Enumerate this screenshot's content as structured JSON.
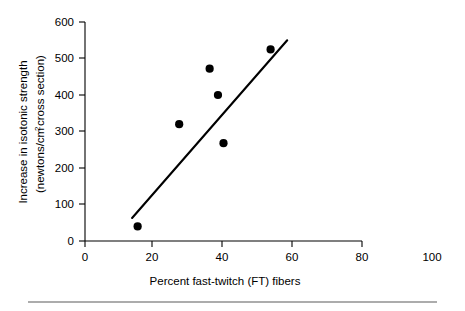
{
  "chart_data": {
    "type": "scatter",
    "title": "",
    "xlabel": "Percent fast-twitch (FT) fibers",
    "ylabel": "Increase in isotonic strength (newtons/cm² cross section)",
    "ylabel_line1": "Increase in isotonic strength",
    "ylabel_line2": "(newtons/cm",
    "ylabel_line2_sup": "2",
    "ylabel_line2_tail": " cross section)",
    "xlim": [
      0,
      100
    ],
    "ylim": [
      0,
      600
    ],
    "xticks": [
      0,
      20,
      40,
      60,
      80,
      100
    ],
    "yticks": [
      0,
      100,
      200,
      300,
      400,
      500,
      600
    ],
    "xtick_labels": [
      "0",
      "20",
      "40",
      "60",
      "80",
      "100"
    ],
    "ytick_labels": [
      "0",
      "100",
      "200",
      "300",
      "400",
      "500",
      "600"
    ],
    "grid": false,
    "legend": false,
    "points": [
      {
        "x": 19,
        "y": 40
      },
      {
        "x": 34,
        "y": 320
      },
      {
        "x": 45,
        "y": 472
      },
      {
        "x": 48,
        "y": 400
      },
      {
        "x": 50,
        "y": 268
      },
      {
        "x": 67,
        "y": 525
      }
    ],
    "trendline": {
      "x1": 17,
      "y1": 63,
      "x2": 73,
      "y2": 550,
      "label": "regression-line"
    },
    "marker_color": "#000000",
    "line_color": "#000000",
    "axis_color": "#000000"
  },
  "footer": {
    "rule_color": "#5a5a5a"
  }
}
